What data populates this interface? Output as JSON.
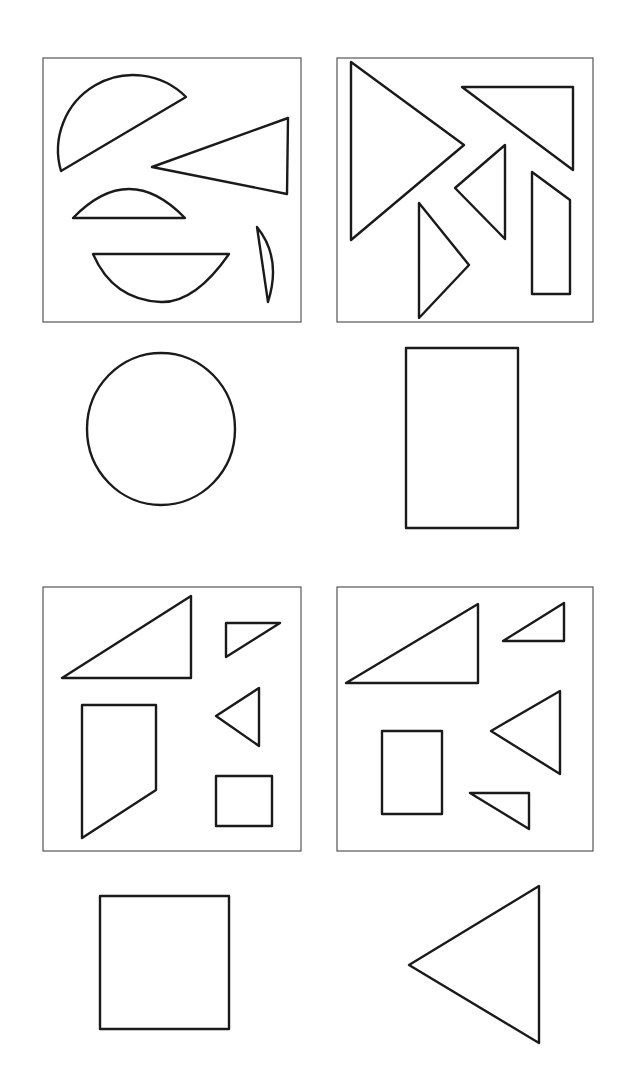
{
  "puzzle": {
    "description": "Shape assembly puzzle: each boxed set of pieces forms the outline shown below it",
    "panels": [
      {
        "id": "panel-1",
        "pieces": [
          "large-semicircle-segment",
          "acute-triangle",
          "small-arc-segment",
          "semicircle-segment",
          "thin-sliver"
        ],
        "target": "circle"
      },
      {
        "id": "panel-2",
        "pieces": [
          "large-isosceles-triangle",
          "right-triangle",
          "small-triangle",
          "right-triangle-lower",
          "trapezoid"
        ],
        "target": "rectangle"
      },
      {
        "id": "panel-3",
        "pieces": [
          "large-right-triangle",
          "small-right-triangle",
          "small-triangle",
          "trapezoid",
          "small-square"
        ],
        "target": "square"
      },
      {
        "id": "panel-4",
        "pieces": [
          "large-right-triangle",
          "small-right-triangle",
          "medium-triangle",
          "rectangle",
          "small-right-triangle-lower"
        ],
        "target": "triangle"
      }
    ],
    "colors": {
      "stroke": "#1a1a1a",
      "frame": "#555555",
      "background": "#ffffff"
    }
  }
}
